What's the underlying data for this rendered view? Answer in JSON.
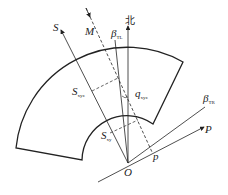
{
  "diagram": {
    "labels": {
      "S": "S",
      "M": "M",
      "beta_TL": "β",
      "beta_TL_sub": "TL",
      "north": "北",
      "S_xyz": "S",
      "S_xyz_sub": "xyz",
      "q_xyz": "q",
      "q_xyz_sub": "xyz",
      "S_xy": "S",
      "S_xy_sub": "xy",
      "beta_TR": "β",
      "beta_TR_sub": "TR",
      "P": "P",
      "p": "p",
      "O": "O"
    },
    "colors": {
      "line": "#222222",
      "background": "#ffffff"
    }
  }
}
